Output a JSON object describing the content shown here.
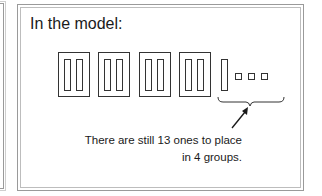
{
  "title": "In the model:",
  "model": {
    "tens_blocks": 4,
    "loose_ones_bars": 1,
    "ones_squares": 3,
    "line_color": "#333333"
  },
  "caption": {
    "line1": "There are still 13 ones to place",
    "line2": "in 4 groups."
  }
}
